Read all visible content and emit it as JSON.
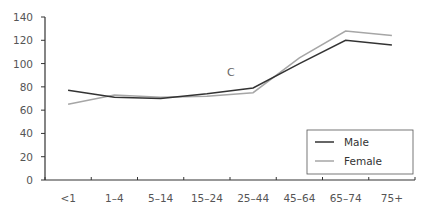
{
  "chart_data": {
    "type": "line",
    "title": "",
    "xlabel": "",
    "ylabel": "",
    "categories": [
      "<1",
      "1–4",
      "5–14",
      "15–24",
      "25–44",
      "45–64",
      "65–74",
      "75+"
    ],
    "series": [
      {
        "name": "Male",
        "color": "#333333",
        "values": [
          77,
          71,
          70,
          74,
          79,
          100,
          120,
          116
        ]
      },
      {
        "name": "Female",
        "color": "#a6a6a6",
        "values": [
          65,
          73,
          71,
          72,
          75,
          105,
          128,
          124
        ]
      }
    ],
    "ylim": [
      0,
      140
    ],
    "yticks": [
      0,
      20,
      40,
      60,
      80,
      100,
      120,
      140
    ],
    "grid": false,
    "legend": {
      "position": "lower right",
      "entries": [
        "Male",
        "Female"
      ]
    },
    "annotations": [
      {
        "text": "C",
        "category": "15–24",
        "y": 83
      }
    ]
  },
  "axis": {
    "yticks": [
      "0",
      "20",
      "40",
      "60",
      "80",
      "100",
      "120",
      "140"
    ],
    "xticks": [
      "<1",
      "1–4",
      "5–14",
      "15–24",
      "25–44",
      "45–64",
      "65–74",
      "75+"
    ]
  },
  "legend": {
    "male": "Male",
    "female": "Female"
  },
  "annotation": "C"
}
